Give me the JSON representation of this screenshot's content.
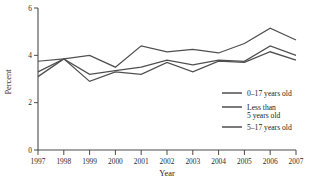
{
  "chart_data": {
    "type": "line",
    "title": "",
    "xlabel": "Year",
    "ylabel": "Percent",
    "x": [
      1997,
      1998,
      1999,
      2000,
      2001,
      2002,
      2003,
      2004,
      2005,
      2006,
      2007
    ],
    "xtick_labels": [
      "1997",
      "1998",
      "1999",
      "2000",
      "2001",
      "2002",
      "2003",
      "2004",
      "2005",
      "2006",
      "2007"
    ],
    "ytick_labels": [
      "0",
      "2",
      "4",
      "6"
    ],
    "yticks": [
      0,
      2,
      4,
      6
    ],
    "ylim": [
      0,
      6
    ],
    "xlim": [
      1997,
      2007
    ],
    "grid": false,
    "legend_position": "right-middle",
    "series": [
      {
        "name": "0–17 years old",
        "color": "#4f4f4f",
        "values": [
          3.75,
          3.85,
          4.0,
          3.5,
          4.4,
          4.15,
          4.25,
          4.1,
          4.5,
          5.15,
          4.65
        ]
      },
      {
        "name": "Less than 5 years old",
        "color": "#4f4f4f",
        "values": [
          3.3,
          3.85,
          3.2,
          3.35,
          3.5,
          3.8,
          3.6,
          3.8,
          3.75,
          4.4,
          4.0
        ]
      },
      {
        "name": "5–17 years old",
        "color": "#4f4f4f",
        "values": [
          3.1,
          3.85,
          2.9,
          3.3,
          3.2,
          3.7,
          3.3,
          3.75,
          3.7,
          4.15,
          3.8
        ]
      }
    ]
  },
  "legend": {
    "entries": [
      {
        "label": "0–17 years old",
        "line2": ""
      },
      {
        "label": "Less than",
        "line2": "5 years old"
      },
      {
        "label": "5–17 years old",
        "line2": ""
      }
    ]
  },
  "axis_titles": {
    "x": "Year",
    "y": "Percent"
  },
  "colors": {
    "axis": "#4a4a4a",
    "line": "#4f4f4f",
    "text": "#1c1c1c",
    "background": "#ffffff"
  }
}
